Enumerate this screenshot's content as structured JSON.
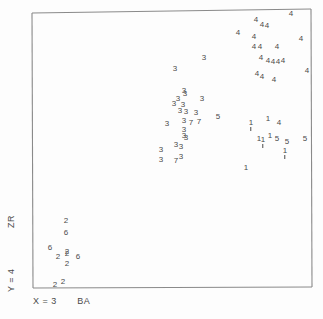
{
  "figure": {
    "kind": "scatter-plot",
    "background": "#fdfdfd",
    "frame_color": "#8a8a8a",
    "marker_color": "#4a4a4a"
  },
  "axes": {
    "x_label": "X = 3",
    "x_label_secondary": "BA",
    "y_label": "Y = 4",
    "y_label_secondary": "ZR"
  },
  "chart_data": {
    "type": "scatter",
    "title": "",
    "xlabel": "X = 3   BA",
    "ylabel": "Y = 4   ZR",
    "xlim": [
      0,
      100
    ],
    "ylim": [
      0,
      100
    ],
    "grid": false,
    "legend": "none",
    "marker_style": "group-digit-glyph",
    "note": "Each plotted point is drawn as the digit of its group/cluster number (1-7). Coordinates below are in screenshot pixel space of the plotting frame.",
    "groups": [
      "1",
      "2",
      "3",
      "4",
      "5",
      "6",
      "7"
    ],
    "points": [
      {
        "label": "4",
        "x": 291,
        "y": 14
      },
      {
        "label": "4",
        "x": 256,
        "y": 20
      },
      {
        "label": "4",
        "x": 262,
        "y": 25
      },
      {
        "label": "4",
        "x": 267,
        "y": 26
      },
      {
        "label": "4",
        "x": 238,
        "y": 33
      },
      {
        "label": "4",
        "x": 254,
        "y": 37
      },
      {
        "label": "4",
        "x": 301,
        "y": 39
      },
      {
        "label": "4",
        "x": 254,
        "y": 47
      },
      {
        "label": "4",
        "x": 260,
        "y": 47
      },
      {
        "label": "4",
        "x": 277,
        "y": 47
      },
      {
        "label": "4",
        "x": 261,
        "y": 58
      },
      {
        "label": "4",
        "x": 268,
        "y": 61
      },
      {
        "label": "4",
        "x": 273,
        "y": 62
      },
      {
        "label": "4",
        "x": 278,
        "y": 62
      },
      {
        "label": "4",
        "x": 283,
        "y": 61
      },
      {
        "label": "4",
        "x": 307,
        "y": 71
      },
      {
        "label": "4",
        "x": 257,
        "y": 74
      },
      {
        "label": "4",
        "x": 262,
        "y": 77
      },
      {
        "label": "4",
        "x": 274,
        "y": 80
      },
      {
        "label": "3",
        "x": 204,
        "y": 58
      },
      {
        "label": "3",
        "x": 175,
        "y": 69
      },
      {
        "label": "3",
        "x": 184,
        "y": 91
      },
      {
        "label": "3",
        "x": 185,
        "y": 94
      },
      {
        "label": "3",
        "x": 178,
        "y": 99
      },
      {
        "label": "3",
        "x": 202,
        "y": 99
      },
      {
        "label": "3",
        "x": 174,
        "y": 104
      },
      {
        "label": "3",
        "x": 183,
        "y": 105
      },
      {
        "label": "3",
        "x": 180,
        "y": 111
      },
      {
        "label": "3",
        "x": 186,
        "y": 112
      },
      {
        "label": "3",
        "x": 196,
        "y": 113
      },
      {
        "label": "3",
        "x": 167,
        "y": 124
      },
      {
        "label": "3",
        "x": 184,
        "y": 121
      },
      {
        "label": "7",
        "x": 191,
        "y": 123
      },
      {
        "label": "7",
        "x": 199,
        "y": 122
      },
      {
        "label": "3",
        "x": 184,
        "y": 130
      },
      {
        "label": "3",
        "x": 184,
        "y": 136
      },
      {
        "label": "3",
        "x": 186,
        "y": 138
      },
      {
        "label": "3",
        "x": 176,
        "y": 145
      },
      {
        "label": "3",
        "x": 181,
        "y": 147
      },
      {
        "label": "3",
        "x": 161,
        "y": 150
      },
      {
        "label": "3",
        "x": 161,
        "y": 160
      },
      {
        "label": "3",
        "x": 181,
        "y": 157
      },
      {
        "label": "7",
        "x": 176,
        "y": 161
      },
      {
        "label": "5",
        "x": 218,
        "y": 117
      },
      {
        "label": "5",
        "x": 277,
        "y": 139
      },
      {
        "label": "5",
        "x": 287,
        "y": 142
      },
      {
        "label": "5",
        "x": 305,
        "y": 139
      },
      {
        "label": "1",
        "x": 251,
        "y": 123,
        "tick": true
      },
      {
        "label": "1",
        "x": 268,
        "y": 119
      },
      {
        "label": "4",
        "x": 279,
        "y": 123
      },
      {
        "label": "1",
        "x": 259,
        "y": 139
      },
      {
        "label": "1",
        "x": 263,
        "y": 140,
        "tick": true
      },
      {
        "label": "1",
        "x": 270,
        "y": 136
      },
      {
        "label": "1",
        "x": 285,
        "y": 151,
        "tick": true
      },
      {
        "label": "1",
        "x": 246,
        "y": 168
      },
      {
        "label": "2",
        "x": 66,
        "y": 221
      },
      {
        "label": "6",
        "x": 66,
        "y": 233
      },
      {
        "label": "6",
        "x": 50,
        "y": 248
      },
      {
        "label": "2",
        "x": 58,
        "y": 257
      },
      {
        "label": "2",
        "x": 67,
        "y": 254
      },
      {
        "label": "2",
        "x": 67,
        "y": 252
      },
      {
        "label": "6",
        "x": 78,
        "y": 257
      },
      {
        "label": "2",
        "x": 67,
        "y": 264
      },
      {
        "label": "2",
        "x": 55,
        "y": 285
      },
      {
        "label": "2",
        "x": 63,
        "y": 282
      }
    ]
  }
}
